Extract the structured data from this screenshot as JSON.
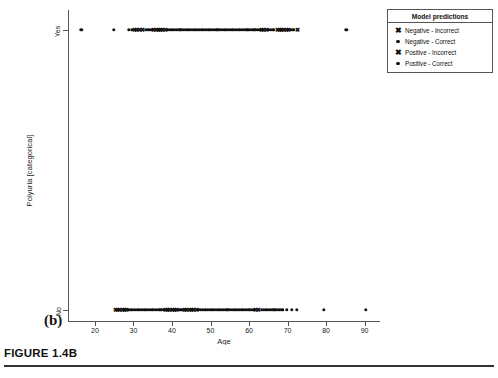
{
  "caption": {
    "text": "FIGURE 1.4B"
  },
  "figure": {
    "subplot_label": "(b)"
  },
  "legend": {
    "title": "Model predictions",
    "entries": [
      {
        "marker": "x-marker",
        "glyph": "✖",
        "label": "Negative - Incorrect"
      },
      {
        "marker": "dot-marker",
        "glyph": "",
        "label": "Negative - Correct"
      },
      {
        "marker": "x-marker",
        "glyph": "✖",
        "label": "Positive - Incorrect"
      },
      {
        "marker": "dot-marker",
        "glyph": "",
        "label": "Positive - Correct"
      }
    ]
  },
  "chart_data": {
    "type": "scatter",
    "title": "",
    "xlabel": "Age",
    "ylabel": "Polyuria [categorical]",
    "xlim": [
      13,
      94
    ],
    "xticks": [
      20,
      30,
      40,
      50,
      60,
      70,
      80,
      90
    ],
    "xticklabels": [
      "20",
      "30",
      "40",
      "50",
      "60",
      "70",
      "80",
      "90"
    ],
    "yticks": [
      "No",
      "Yes"
    ],
    "yticklabels": [
      "No",
      "Yes"
    ],
    "ycategories": [
      "Yes",
      "No"
    ],
    "grid": false,
    "legend_position": "upper right",
    "series": [
      {
        "name": "Negative - Incorrect",
        "marker": "x",
        "y": "Yes",
        "x": [
          30.0,
          30.6,
          31.2,
          32.0,
          35.0,
          35.6,
          36.2,
          36.8,
          37.4,
          38.0,
          63.0,
          63.6,
          64.2,
          67.0,
          67.6,
          68.2,
          68.8,
          69.4,
          70.0,
          72.3
        ]
      },
      {
        "name": "Negative - Correct",
        "marker": "dot",
        "y": "Yes",
        "x": [
          16.2,
          24.7,
          28.6,
          29.3,
          33.0,
          33.6,
          34.2,
          34.8,
          38.6,
          39.2,
          39.8,
          40.4,
          41.0,
          41.6,
          42.2,
          42.8,
          43.4,
          44.0,
          44.6,
          45.2,
          45.8,
          46.4,
          47.0,
          47.6,
          48.2,
          48.8,
          49.4,
          50.0,
          50.6,
          51.2,
          51.8,
          52.4,
          53.0,
          53.6,
          54.2,
          54.8,
          55.4,
          56.0,
          56.6,
          57.2,
          57.8,
          58.4,
          59.0,
          59.6,
          60.2,
          60.8,
          61.4,
          62.0,
          62.6,
          64.8,
          65.4,
          66.0,
          70.6,
          71.2,
          85.0
        ]
      },
      {
        "name": "Positive - Incorrect",
        "marker": "x",
        "y": "No",
        "x": [
          25.0,
          25.6,
          26.2,
          26.8,
          27.4,
          28.0,
          38.0,
          38.6,
          39.2,
          39.8,
          40.4,
          41.0,
          43.0,
          43.6,
          44.2,
          44.8,
          45.4,
          46.0,
          61.5,
          62.1
        ]
      },
      {
        "name": "Positive - Correct",
        "marker": "dot",
        "y": "No",
        "x": [
          28.6,
          29.2,
          29.8,
          30.4,
          31.0,
          31.6,
          32.2,
          32.8,
          33.4,
          34.0,
          34.6,
          35.2,
          35.8,
          36.4,
          37.0,
          37.6,
          41.6,
          42.2,
          42.8,
          46.6,
          47.2,
          47.8,
          48.4,
          49.0,
          49.6,
          50.2,
          50.8,
          51.4,
          52.0,
          52.6,
          53.2,
          53.8,
          54.4,
          55.0,
          55.6,
          56.2,
          56.8,
          57.4,
          58.0,
          58.6,
          59.2,
          59.8,
          60.4,
          61.0,
          63.0,
          63.6,
          64.2,
          64.8,
          65.4,
          66.0,
          66.6,
          67.2,
          67.8,
          68.4,
          69.6,
          70.8,
          72.2,
          79.2,
          90.0
        ]
      }
    ]
  }
}
